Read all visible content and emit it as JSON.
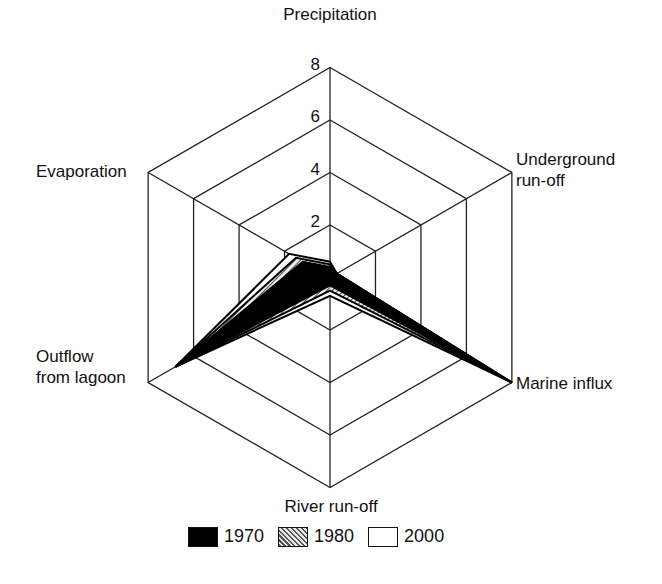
{
  "chart_data": {
    "type": "radar",
    "title": "",
    "axes": [
      "Precipitation",
      "Underground run-off",
      "Marine influx",
      "River run-off",
      "Outflow from lagoon",
      "Evaporation"
    ],
    "axis_display": [
      [
        "Precipitation"
      ],
      [
        "Underground",
        "run-off"
      ],
      [
        "Marine influx"
      ],
      [
        "River run-off"
      ],
      [
        "Outflow",
        "from lagoon"
      ],
      [
        "Evaporation"
      ]
    ],
    "ticks": [
      2,
      4,
      6,
      8
    ],
    "range": [
      0,
      8
    ],
    "grid": true,
    "legend_position": "bottom",
    "series": [
      {
        "name": "1970",
        "fill": "solid-black",
        "values": [
          0.4,
          0.3,
          8.0,
          0.3,
          6.8,
          1.2
        ]
      },
      {
        "name": "1980",
        "fill": "hatched",
        "values": [
          0.5,
          0.3,
          8.0,
          0.5,
          6.8,
          1.5
        ]
      },
      {
        "name": "2000",
        "fill": "white",
        "values": [
          0.6,
          0.3,
          8.0,
          0.7,
          6.8,
          1.8
        ]
      }
    ]
  },
  "legend": {
    "items": [
      {
        "label": "1970"
      },
      {
        "label": "1980"
      },
      {
        "label": "2000"
      }
    ]
  }
}
